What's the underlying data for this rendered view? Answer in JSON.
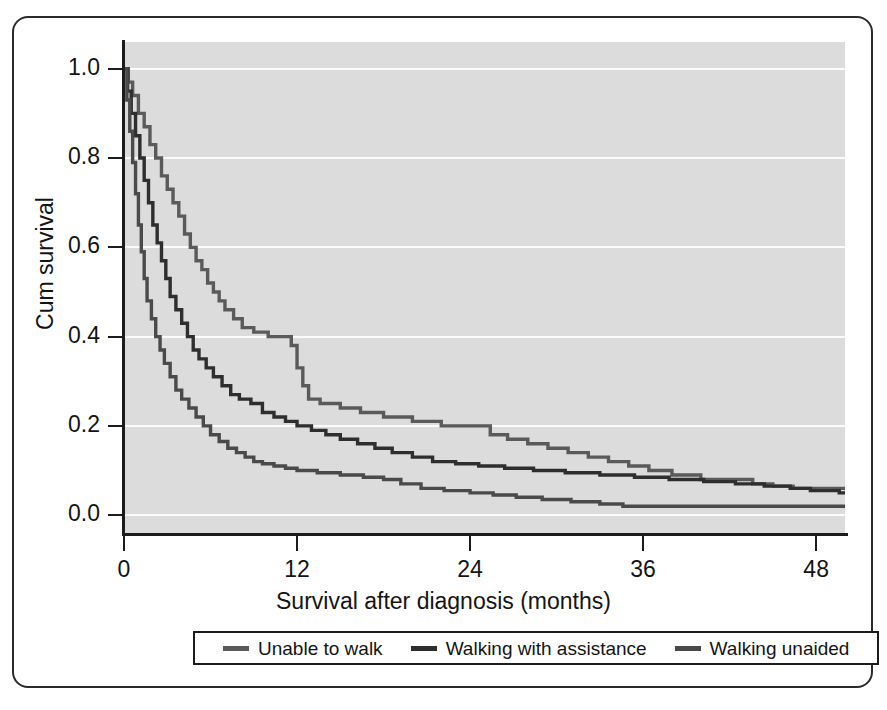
{
  "chart_data": {
    "type": "line",
    "title": "",
    "xlabel": "Survival after diagnosis (months)",
    "ylabel": "Cum survival",
    "xlim": [
      0,
      50
    ],
    "ylim": [
      -0.04,
      1.06
    ],
    "xticks": [
      0,
      12,
      24,
      36,
      48
    ],
    "xtick_labels": [
      "0",
      "12",
      "24",
      "36",
      "48"
    ],
    "yticks": [
      0.0,
      0.2,
      0.4,
      0.6,
      0.8,
      1.0
    ],
    "ytick_labels": [
      "0.0",
      "0.2",
      "0.4",
      "0.6",
      "0.8",
      "1.0"
    ],
    "grid": true,
    "grid_color": "#fbfbfb",
    "plot_background": "#dcdcdc",
    "legend_position": "below-axis",
    "step_style": "post",
    "series": [
      {
        "name": "Unable to walk",
        "color": "#5a5a5a",
        "points": [
          [
            0.0,
            1.0
          ],
          [
            0.3,
            0.97
          ],
          [
            0.6,
            0.94
          ],
          [
            1.0,
            0.9
          ],
          [
            1.4,
            0.87
          ],
          [
            1.8,
            0.83
          ],
          [
            2.2,
            0.8
          ],
          [
            2.6,
            0.76
          ],
          [
            3.0,
            0.73
          ],
          [
            3.4,
            0.7
          ],
          [
            3.8,
            0.67
          ],
          [
            4.2,
            0.63
          ],
          [
            4.6,
            0.6
          ],
          [
            5.0,
            0.57
          ],
          [
            5.4,
            0.55
          ],
          [
            5.8,
            0.52
          ],
          [
            6.2,
            0.5
          ],
          [
            6.6,
            0.48
          ],
          [
            7.0,
            0.46
          ],
          [
            7.6,
            0.44
          ],
          [
            8.2,
            0.42
          ],
          [
            9.0,
            0.41
          ],
          [
            10.0,
            0.4
          ],
          [
            11.0,
            0.4
          ],
          [
            11.6,
            0.38
          ],
          [
            12.0,
            0.33
          ],
          [
            12.4,
            0.29
          ],
          [
            12.8,
            0.26
          ],
          [
            13.6,
            0.25
          ],
          [
            15.0,
            0.24
          ],
          [
            16.4,
            0.23
          ],
          [
            18.0,
            0.22
          ],
          [
            20.0,
            0.21
          ],
          [
            22.0,
            0.2
          ],
          [
            24.0,
            0.2
          ],
          [
            25.4,
            0.18
          ],
          [
            26.6,
            0.17
          ],
          [
            28.0,
            0.16
          ],
          [
            29.4,
            0.15
          ],
          [
            30.8,
            0.14
          ],
          [
            32.2,
            0.13
          ],
          [
            33.6,
            0.12
          ],
          [
            35.0,
            0.11
          ],
          [
            36.4,
            0.1
          ],
          [
            38.0,
            0.09
          ],
          [
            40.0,
            0.08
          ],
          [
            42.0,
            0.08
          ],
          [
            43.6,
            0.07
          ],
          [
            45.0,
            0.065
          ],
          [
            46.4,
            0.06
          ],
          [
            49.6,
            0.06
          ]
        ]
      },
      {
        "name": "Walking with assistance",
        "color": "#2e2e2e",
        "points": [
          [
            0.0,
            1.0
          ],
          [
            0.25,
            0.95
          ],
          [
            0.5,
            0.9
          ],
          [
            0.8,
            0.85
          ],
          [
            1.1,
            0.8
          ],
          [
            1.4,
            0.75
          ],
          [
            1.7,
            0.7
          ],
          [
            2.0,
            0.65
          ],
          [
            2.3,
            0.61
          ],
          [
            2.6,
            0.57
          ],
          [
            2.9,
            0.53
          ],
          [
            3.2,
            0.49
          ],
          [
            3.6,
            0.46
          ],
          [
            4.0,
            0.43
          ],
          [
            4.4,
            0.4
          ],
          [
            4.8,
            0.37
          ],
          [
            5.2,
            0.35
          ],
          [
            5.7,
            0.33
          ],
          [
            6.2,
            0.31
          ],
          [
            6.8,
            0.29
          ],
          [
            7.4,
            0.27
          ],
          [
            8.0,
            0.26
          ],
          [
            8.8,
            0.25
          ],
          [
            9.6,
            0.23
          ],
          [
            10.4,
            0.22
          ],
          [
            11.2,
            0.21
          ],
          [
            12.0,
            0.2
          ],
          [
            13.0,
            0.19
          ],
          [
            14.0,
            0.18
          ],
          [
            15.0,
            0.17
          ],
          [
            16.2,
            0.16
          ],
          [
            17.4,
            0.15
          ],
          [
            18.6,
            0.14
          ],
          [
            20.0,
            0.13
          ],
          [
            21.4,
            0.12
          ],
          [
            23.0,
            0.115
          ],
          [
            24.6,
            0.11
          ],
          [
            26.4,
            0.105
          ],
          [
            28.4,
            0.1
          ],
          [
            30.6,
            0.095
          ],
          [
            33.0,
            0.09
          ],
          [
            35.4,
            0.085
          ],
          [
            37.8,
            0.08
          ],
          [
            40.2,
            0.075
          ],
          [
            42.4,
            0.07
          ],
          [
            44.4,
            0.065
          ],
          [
            46.2,
            0.06
          ],
          [
            47.6,
            0.055
          ],
          [
            49.6,
            0.05
          ]
        ]
      },
      {
        "name": "Walking unaided",
        "color": "#4a4a4a",
        "points": [
          [
            0.0,
            1.0
          ],
          [
            0.2,
            0.93
          ],
          [
            0.4,
            0.86
          ],
          [
            0.6,
            0.79
          ],
          [
            0.8,
            0.72
          ],
          [
            1.0,
            0.65
          ],
          [
            1.2,
            0.59
          ],
          [
            1.4,
            0.53
          ],
          [
            1.6,
            0.48
          ],
          [
            1.9,
            0.44
          ],
          [
            2.2,
            0.4
          ],
          [
            2.5,
            0.37
          ],
          [
            2.8,
            0.34
          ],
          [
            3.2,
            0.31
          ],
          [
            3.6,
            0.28
          ],
          [
            4.0,
            0.26
          ],
          [
            4.5,
            0.24
          ],
          [
            5.0,
            0.22
          ],
          [
            5.5,
            0.2
          ],
          [
            6.0,
            0.18
          ],
          [
            6.6,
            0.165
          ],
          [
            7.2,
            0.15
          ],
          [
            7.8,
            0.14
          ],
          [
            8.4,
            0.13
          ],
          [
            9.0,
            0.12
          ],
          [
            9.6,
            0.115
          ],
          [
            10.4,
            0.11
          ],
          [
            11.2,
            0.105
          ],
          [
            12.0,
            0.1
          ],
          [
            13.4,
            0.095
          ],
          [
            15.0,
            0.09
          ],
          [
            16.6,
            0.085
          ],
          [
            18.0,
            0.08
          ],
          [
            19.2,
            0.07
          ],
          [
            20.6,
            0.06
          ],
          [
            22.2,
            0.055
          ],
          [
            24.0,
            0.05
          ],
          [
            25.6,
            0.045
          ],
          [
            27.2,
            0.04
          ],
          [
            29.0,
            0.035
          ],
          [
            31.0,
            0.03
          ],
          [
            33.0,
            0.025
          ],
          [
            34.6,
            0.02
          ],
          [
            40.0,
            0.02
          ],
          [
            49.6,
            0.02
          ]
        ]
      }
    ]
  },
  "legend": {
    "items": [
      {
        "label": "Unable to walk",
        "color": "#5a5a5a"
      },
      {
        "label": "Walking with assistance",
        "color": "#2e2e2e"
      },
      {
        "label": "Walking unaided",
        "color": "#4a4a4a"
      }
    ]
  }
}
